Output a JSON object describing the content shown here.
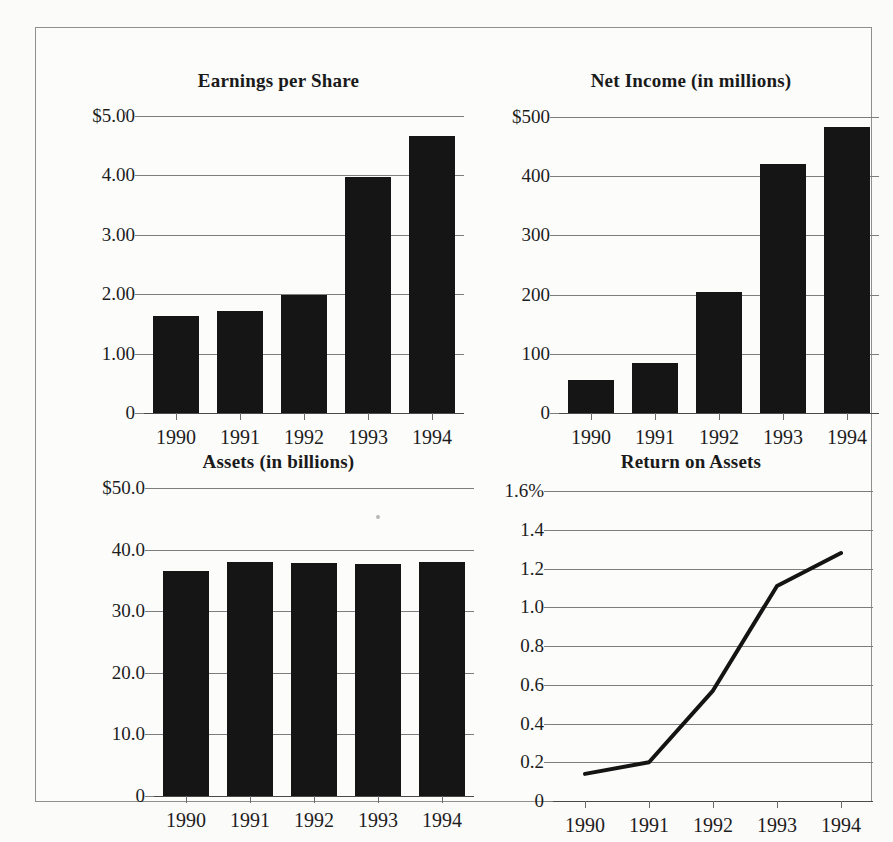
{
  "page": {
    "background_color": "#fbfbfa",
    "frame_color": "#8f8f8f",
    "ink_color": "#151515"
  },
  "chart_data": [
    {
      "id": "earnings-per-share",
      "type": "bar",
      "title": "Earnings per Share",
      "xlabel": "",
      "ylabel": "",
      "categories": [
        "1990",
        "1991",
        "1992",
        "1993",
        "1994"
      ],
      "values": [
        1.64,
        1.72,
        1.99,
        3.97,
        4.67
      ],
      "ylim": [
        0,
        5
      ],
      "yticks": [
        0,
        1,
        2,
        3,
        4,
        5
      ],
      "ytick_labels": [
        "0",
        "1.00",
        "2.00",
        "3.00",
        "4.00",
        "$5.00"
      ],
      "grid": true,
      "legend": "none",
      "bar_color": "#151515"
    },
    {
      "id": "net-income",
      "type": "bar",
      "title": "Net Income (in millions)",
      "xlabel": "",
      "ylabel": "",
      "categories": [
        "1990",
        "1991",
        "1992",
        "1993",
        "1994"
      ],
      "values": [
        55,
        85,
        205,
        420,
        483
      ],
      "ylim": [
        0,
        500
      ],
      "yticks": [
        0,
        100,
        200,
        300,
        400,
        500
      ],
      "ytick_labels": [
        "0",
        "100",
        "200",
        "300",
        "400",
        "$500"
      ],
      "grid": true,
      "legend": "none",
      "bar_color": "#151515"
    },
    {
      "id": "assets",
      "type": "bar",
      "title": "Assets (in billions)",
      "xlabel": "",
      "ylabel": "",
      "categories": [
        "1990",
        "1991",
        "1992",
        "1993",
        "1994"
      ],
      "values": [
        36.6,
        38.0,
        37.8,
        37.6,
        38.0
      ],
      "ylim": [
        0,
        50
      ],
      "yticks": [
        0,
        10,
        20,
        30,
        40,
        50
      ],
      "ytick_labels": [
        "0",
        "10.0",
        "20.0",
        "30.0",
        "40.0",
        "$50.0"
      ],
      "grid": true,
      "legend": "none",
      "bar_color": "#151515"
    },
    {
      "id": "return-on-assets",
      "type": "line",
      "title": "Return on Assets",
      "xlabel": "",
      "ylabel": "",
      "categories": [
        "1990",
        "1991",
        "1992",
        "1993",
        "1994"
      ],
      "values": [
        0.14,
        0.2,
        0.57,
        1.11,
        1.28
      ],
      "ylim": [
        0,
        1.6
      ],
      "yticks": [
        0,
        0.2,
        0.4,
        0.6,
        0.8,
        1.0,
        1.2,
        1.4,
        1.6
      ],
      "ytick_labels": [
        "0",
        "0.2",
        "0.4",
        "0.6",
        "0.8",
        "1.0",
        "1.2",
        "1.4",
        "1.6%"
      ],
      "grid": true,
      "legend": "none",
      "line_color": "#141414"
    }
  ]
}
